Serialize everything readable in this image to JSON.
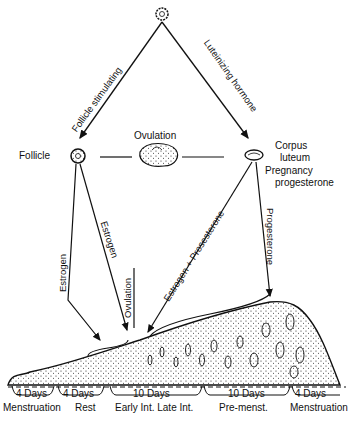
{
  "diagram": {
    "top_gland": {
      "name": "pituitary-gland"
    },
    "left_arrow_label": "Follicle stimulating",
    "right_arrow_label": "Luteinizing hormone",
    "follicle_label": "Follicle",
    "ovulation_label": "Ovulation",
    "corpus_luteum_label_1": "Corpus",
    "corpus_luteum_label_2": "luteum",
    "pregnancy_label_1": "Pregnancy",
    "pregnancy_label_2": "progesterone",
    "estrogen_left": "Estrogen",
    "estrogen_mid": "Estrogen",
    "ovulation_vertical": "Ovulation",
    "estrogen_progesterone": "Estrogen + Prosesterone",
    "progesterone": "Progesterone"
  },
  "timeline": {
    "phases": [
      {
        "days": "4 Days",
        "name": "Menstruation"
      },
      {
        "days": "4 Days",
        "name": "Rest"
      },
      {
        "days": "10 Days",
        "name": "Early Int. Late Int."
      },
      {
        "days": "10 Days",
        "name": "Pre-menst."
      },
      {
        "days": "4 Days",
        "name": "Menstruation"
      }
    ]
  }
}
